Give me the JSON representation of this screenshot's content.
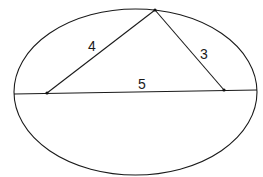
{
  "diagram": {
    "type": "geometry",
    "ellipse": {
      "cx": 135.5,
      "cy": 92,
      "rx": 121.5,
      "ry": 83
    },
    "chord": {
      "x1": 14,
      "y1": 94,
      "x2": 257,
      "y2": 90
    },
    "vertices": {
      "top": {
        "x": 155,
        "y": 10
      },
      "left": {
        "x": 47,
        "y": 93
      },
      "right": {
        "x": 224,
        "y": 90
      }
    },
    "labels": {
      "left_side": "4",
      "right_side": "3",
      "base": "5"
    },
    "colors": {
      "line": "#1a1a1a",
      "background": "#ffffff"
    }
  }
}
